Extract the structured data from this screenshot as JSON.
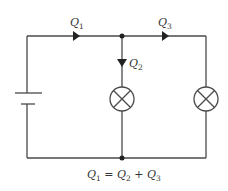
{
  "diagram": {
    "type": "electric-circuit",
    "labels": {
      "q1": {
        "main": "Q",
        "sub": "1"
      },
      "q2": {
        "main": "Q",
        "sub": "2"
      },
      "q3": {
        "main": "Q",
        "sub": "3"
      }
    },
    "equation": {
      "parts": [
        {
          "main": "Q",
          "sub": "1"
        },
        {
          "op": " = "
        },
        {
          "main": "Q",
          "sub": "2"
        },
        {
          "op": " + "
        },
        {
          "main": "Q",
          "sub": "3"
        }
      ],
      "text": "Q1 = Q2 + Q3"
    },
    "components": [
      {
        "name": "battery",
        "kind": "cell"
      },
      {
        "name": "lamp-middle",
        "kind": "lamp"
      },
      {
        "name": "lamp-right",
        "kind": "lamp"
      }
    ],
    "colors": {
      "wire": "#4a4a4a",
      "text": "#333333",
      "background": "#ffffff"
    }
  }
}
